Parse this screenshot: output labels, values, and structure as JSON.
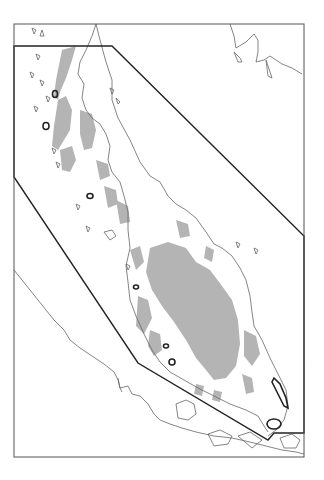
{
  "map": {
    "width": 324,
    "height": 480,
    "frame": {
      "x": 14,
      "y": 24,
      "w": 290,
      "h": 433,
      "stroke": "#555555"
    },
    "study_area_polygon": {
      "points": "14,46 112,46 304,236 304,433 274,433 268,440 138,363 14,177",
      "stroke": "#222222",
      "stroke_width": 1.4
    },
    "colors": {
      "land_fill": "#ffffff",
      "coastline": "#666666",
      "highland_fill": "#b4b4b4",
      "outlined_features": "#222222"
    },
    "labels": []
  }
}
